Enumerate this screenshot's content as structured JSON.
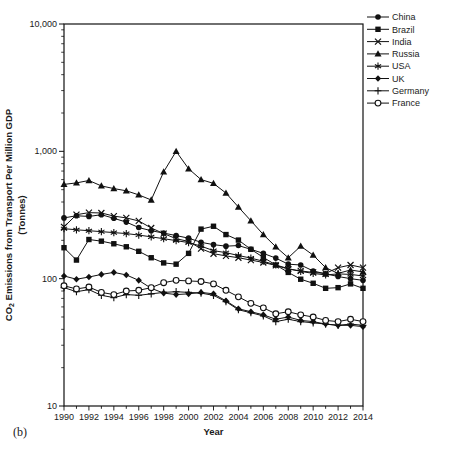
{
  "figure_label": "(b)",
  "chart_data": {
    "type": "line",
    "title": "",
    "xlabel": "Year",
    "ylabel": {
      "prefix": "CO",
      "subscript": "2",
      "rest": " Emissions from Transport Per Million GDP",
      "line2": "(Tonnes)"
    },
    "x_range": [
      1990,
      2014
    ],
    "x": [
      1990,
      1991,
      1992,
      1993,
      1994,
      1995,
      1996,
      1997,
      1998,
      1999,
      2000,
      2001,
      2002,
      2003,
      2004,
      2005,
      2006,
      2007,
      2008,
      2009,
      2010,
      2011,
      2012,
      2013,
      2014
    ],
    "x_tick_labels": [
      "1990",
      "1992",
      "1994",
      "1996",
      "1998",
      "2000",
      "2002",
      "2004",
      "2006",
      "2008",
      "2010",
      "2012",
      "2014"
    ],
    "y_scale": "log",
    "ylim": [
      10,
      10000
    ],
    "y_ticks": [
      10,
      100,
      1000,
      10000
    ],
    "y_tick_labels": [
      "10",
      "100",
      "1,000",
      "10,000"
    ],
    "grid": false,
    "legend_position": "top-right-outside",
    "colors": {
      "line": "#111111",
      "background": "#ffffff"
    },
    "series": [
      {
        "name": "China",
        "marker": "filled-circle",
        "values": [
          300,
          312,
          308,
          318,
          298,
          278,
          252,
          238,
          228,
          218,
          208,
          193,
          185,
          180,
          182,
          170,
          158,
          145,
          130,
          128,
          115,
          109,
          104,
          100,
          97
        ]
      },
      {
        "name": "Brazil",
        "marker": "filled-square",
        "values": [
          175,
          140,
          203,
          197,
          188,
          178,
          164,
          146,
          133,
          130,
          158,
          245,
          258,
          222,
          201,
          170,
          147,
          128,
          112,
          99,
          92,
          84,
          85,
          91,
          84
        ]
      },
      {
        "name": "India",
        "marker": "x",
        "values": [
          255,
          318,
          330,
          328,
          310,
          300,
          284,
          250,
          226,
          206,
          196,
          172,
          157,
          151,
          146,
          140,
          134,
          127,
          119,
          115,
          112,
          110,
          122,
          128,
          122
        ]
      },
      {
        "name": "Russia",
        "marker": "filled-triangle",
        "values": [
          550,
          565,
          590,
          535,
          510,
          490,
          455,
          415,
          690,
          1000,
          730,
          600,
          560,
          470,
          365,
          285,
          222,
          178,
          146,
          180,
          153,
          122,
          110,
          117,
          113
        ]
      },
      {
        "name": "USA",
        "marker": "asterisk",
        "values": [
          247,
          242,
          238,
          234,
          230,
          226,
          220,
          213,
          206,
          199,
          192,
          180,
          166,
          160,
          152,
          145,
          137,
          128,
          120,
          114,
          110,
          107,
          109,
          108,
          105
        ]
      },
      {
        "name": "UK",
        "marker": "filled-diamond",
        "values": [
          105,
          99,
          103,
          108,
          112,
          107,
          97,
          84,
          77,
          75,
          76,
          78,
          76,
          67,
          58,
          55,
          52,
          48,
          50,
          47,
          46,
          44,
          43,
          43,
          42
        ]
      },
      {
        "name": "Germany",
        "marker": "plus",
        "values": [
          85,
          79,
          82,
          74,
          71,
          75,
          74,
          76,
          78,
          79,
          78,
          77,
          74,
          66,
          57,
          54,
          51,
          46,
          48,
          46,
          45,
          44,
          43,
          44,
          43
        ]
      },
      {
        "name": "France",
        "marker": "open-circle",
        "values": [
          88,
          83,
          86,
          78,
          75,
          80,
          81,
          85,
          93,
          97,
          96,
          95,
          91,
          81,
          72,
          64,
          59,
          53,
          55,
          52,
          50,
          47,
          46,
          48,
          46
        ]
      }
    ]
  }
}
